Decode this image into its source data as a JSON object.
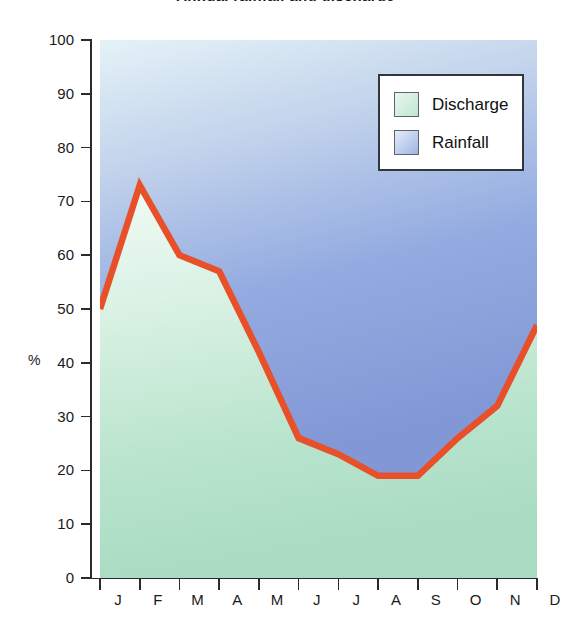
{
  "chart_data": {
    "type": "area",
    "title": "Annual rainfall and discharge",
    "xlabel": "",
    "ylabel": "%",
    "ylim": [
      0,
      100
    ],
    "ytick_step": 10,
    "yticks": [
      100,
      90,
      80,
      70,
      60,
      50,
      40,
      30,
      20,
      10,
      0
    ],
    "categories": [
      "J",
      "F",
      "M",
      "A",
      "M",
      "J",
      "J",
      "A",
      "S",
      "O",
      "N",
      "D"
    ],
    "grid": false,
    "legend_position": "top-right",
    "legend": [
      {
        "label": "Discharge",
        "color": "#bfe6cf"
      },
      {
        "label": "Rainfall",
        "color": "#9fb6e2"
      }
    ],
    "series": [
      {
        "name": "Discharge",
        "values": [
          50,
          73,
          60,
          57,
          42,
          26,
          23,
          19,
          19,
          26,
          32,
          47
        ],
        "line_color": "#e8502a",
        "fill_color": "#bfe6cf"
      },
      {
        "name": "Rainfall",
        "values": [
          50,
          27,
          40,
          43,
          58,
          74,
          77,
          81,
          81,
          74,
          68,
          53
        ],
        "fill_color": "#9fb6e2"
      }
    ],
    "annotations": []
  },
  "axis": {
    "unit_label": "%"
  },
  "legend_box": {
    "items": [
      {
        "label": "Discharge"
      },
      {
        "label": "Rainfall"
      }
    ]
  }
}
